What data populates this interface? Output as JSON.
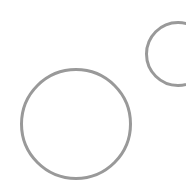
{
  "canvas": {
    "width": 186,
    "height": 194,
    "background": "#ffffff"
  },
  "shapes": [
    {
      "type": "circle",
      "name": "large-circle",
      "cx": 76,
      "cy": 124,
      "r": 54.5,
      "stroke": "#999999",
      "stroke_width": 3,
      "fill": "none"
    },
    {
      "type": "circle",
      "name": "small-circle",
      "cx": 178,
      "cy": 54,
      "r": 31.5,
      "stroke": "#999999",
      "stroke_width": 3,
      "fill": "none"
    }
  ]
}
